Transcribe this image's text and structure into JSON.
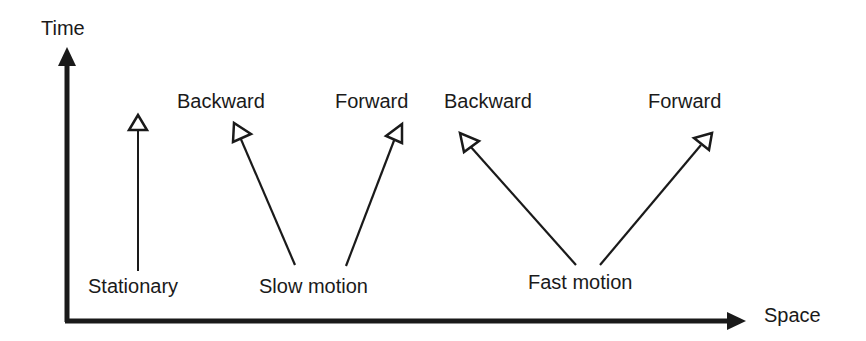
{
  "diagram": {
    "axes": {
      "y_label": "Time",
      "x_label": "Space"
    },
    "categories": [
      {
        "name": "stationary",
        "label": "Stationary",
        "arrows": [
          {
            "direction": "Up"
          }
        ]
      },
      {
        "name": "slow-motion",
        "label": "Slow motion",
        "arrows": [
          {
            "direction": "Backward"
          },
          {
            "direction": "Forward"
          }
        ]
      },
      {
        "name": "fast-motion",
        "label": "Fast motion",
        "arrows": [
          {
            "direction": "Backward"
          },
          {
            "direction": "Forward"
          }
        ]
      }
    ],
    "direction_labels": {
      "slow_backward": "Backward",
      "slow_forward": "Forward",
      "fast_backward": "Backward",
      "fast_forward": "Forward"
    },
    "colors": {
      "ink": "#1a1a1a",
      "background": "#ffffff"
    }
  }
}
